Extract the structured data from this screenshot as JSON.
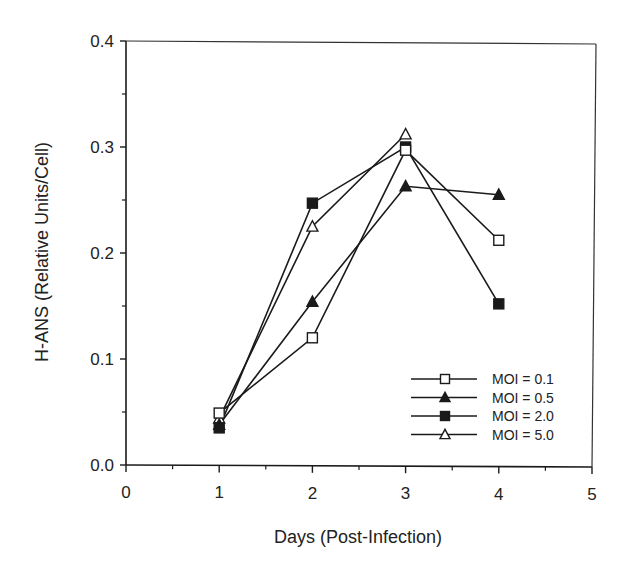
{
  "chart_data": {
    "type": "line",
    "title": "",
    "xlabel": "Days (Post-Infection)",
    "ylabel": "H-ANS (Relative Units/Cell)",
    "xlim": [
      0,
      5
    ],
    "ylim": [
      0.0,
      0.4
    ],
    "x_ticks": [
      0,
      1,
      2,
      3,
      4,
      5
    ],
    "x_tick_labels": [
      "0",
      "1",
      "2",
      "3",
      "4",
      "5"
    ],
    "y_ticks": [
      0.0,
      0.1,
      0.2,
      0.3,
      0.4
    ],
    "y_tick_labels": [
      "0.0",
      "0.1",
      "0.2",
      "0.3",
      "0.4"
    ],
    "grid": false,
    "legend_position": "lower right (inside)",
    "x": [
      1,
      2,
      3,
      4
    ],
    "series": [
      {
        "name": "MOI = 0.1",
        "marker": "open-square",
        "values": [
          0.049,
          0.12,
          0.297,
          0.212
        ]
      },
      {
        "name": "MOI = 0.5",
        "marker": "filled-triangle",
        "values": [
          0.038,
          0.154,
          0.263,
          0.255
        ]
      },
      {
        "name": "MOI = 2.0",
        "marker": "filled-square",
        "values": [
          0.035,
          0.247,
          0.3,
          0.152
        ]
      },
      {
        "name": "MOI = 5.0",
        "marker": "open-triangle",
        "values": [
          0.044,
          0.225,
          0.312,
          null
        ]
      }
    ]
  }
}
